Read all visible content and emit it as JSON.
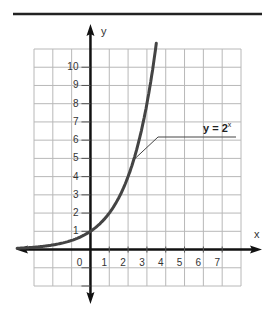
{
  "chart_data": {
    "type": "line",
    "title": "",
    "xlabel": "x",
    "ylabel": "y",
    "xlim": [
      -3,
      8
    ],
    "ylim": [
      -2,
      11
    ],
    "grid": true,
    "x_ticks": [
      "0",
      "1",
      "2",
      "3",
      "4",
      "5",
      "6",
      "7"
    ],
    "y_ticks": [
      "1",
      "2",
      "3",
      "4",
      "5",
      "6",
      "7",
      "8",
      "9",
      "10"
    ],
    "series": [
      {
        "name": "y = 2^x",
        "function": "2^x",
        "x": [
          -3,
          -2,
          -1,
          0,
          1,
          2,
          3,
          3.5
        ],
        "y": [
          0.125,
          0.25,
          0.5,
          1,
          2,
          4,
          8,
          11.3
        ]
      }
    ],
    "annotations": [
      {
        "text": "y = 2",
        "superscript": "x",
        "points_to": [
          2.3,
          4.9
        ]
      }
    ]
  },
  "style": {
    "grid_color": "#b8b8b8",
    "axis_color": "#111111",
    "curve_color": "#444444",
    "rule_color": "#222222"
  }
}
